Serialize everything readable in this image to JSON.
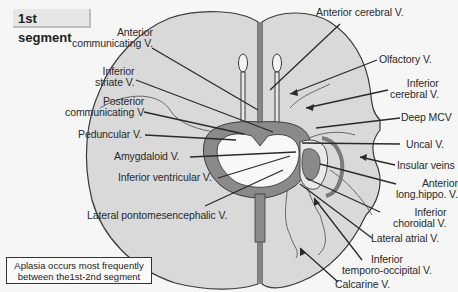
{
  "title": "1st segment",
  "note": {
    "line1": "Aplasia occurs most frequently",
    "line2": "between the1st-2nd segment"
  },
  "colors": {
    "background": "#f6f6f6",
    "brain_fill": "#d9d9d9",
    "outline": "#3a3a3a",
    "dark_vessel": "#8a8a8a",
    "ventricle": "#f8f8f8",
    "leader_line": "#2a2a2a"
  },
  "labels": {
    "anterior_cerebral": "Anterior cerebral V.",
    "anterior_communicating": [
      "Anterior",
      "communicating V."
    ],
    "inferior_striate": [
      "Inferior",
      "striate V."
    ],
    "posterior_communicating": [
      "Posterior",
      "communicating V"
    ],
    "peduncular": "Peduncular V.",
    "amygdaloid": "Amygdaloid V.",
    "inferior_ventricular": "Inferior ventricular V.",
    "lateral_pontomesencephalic": "Lateral pontomesencephalic  V.",
    "olfactory": "Olfactory V.",
    "inferior_cerebral": [
      "Inferior",
      "cerebral V."
    ],
    "deep_mcv": "Deep MCV",
    "uncal": "Uncal V.",
    "insular_veins": "Insular veins",
    "anterior_long_hippo": [
      "Anterior",
      "long.hippo. V."
    ],
    "inferior_choroidal": [
      "Inferior",
      "choroidal V."
    ],
    "lateral_atrial": "Lateral atrial V.",
    "inferior_temporo_occipital": [
      "Inferior",
      "temporo-occipital V."
    ],
    "calcarine": "Calcarine V."
  }
}
